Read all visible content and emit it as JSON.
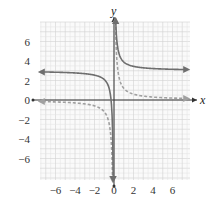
{
  "chart_data": {
    "type": "line",
    "title": "",
    "xlabel": "x",
    "ylabel": "y",
    "xlim": [
      -7.8,
      7.8
    ],
    "ylim": [
      -8.2,
      8.2
    ],
    "grid": true,
    "x_ticks": [
      "−6",
      "−4",
      "−2",
      "0",
      "2",
      "4",
      "6"
    ],
    "x_tick_values": [
      -6,
      -4,
      -2,
      0,
      2,
      4,
      6
    ],
    "y_ticks": [
      "6",
      "4",
      "2",
      "0",
      "−2",
      "−4",
      "−6"
    ],
    "y_tick_values": [
      6,
      4,
      2,
      0,
      -2,
      -4,
      -6
    ],
    "series": [
      {
        "name": "solid curve",
        "equation": "y = 1/x + 3",
        "style": "solid",
        "color": "#6e6e6e",
        "horizontal_asymptote": 3,
        "vertical_asymptote": 0
      },
      {
        "name": "dashed curve",
        "equation": "y = 1/x",
        "style": "dashed",
        "color": "#9a9a9a",
        "horizontal_asymptote": 0,
        "vertical_asymptote": 0
      }
    ]
  },
  "labels": {
    "x_axis": "x",
    "y_axis": "y"
  },
  "colors": {
    "grid_minor": "#e6e6e6",
    "grid_major": "#d2d2d2",
    "axis": "#333333",
    "solid_curve": "#6e6e6e",
    "dashed_curve": "#a0a0a0"
  }
}
